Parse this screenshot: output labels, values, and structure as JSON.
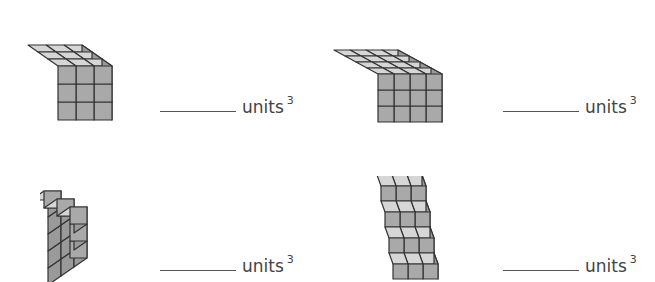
{
  "problems": [
    {
      "id": 1,
      "shape": "rectangular-prism",
      "dims": {
        "width": 3,
        "depth": 3,
        "height": 3
      },
      "answer_blank": "",
      "unit_label": "units",
      "exponent": "3"
    },
    {
      "id": 2,
      "shape": "rectangular-prism",
      "dims": {
        "width": 4,
        "depth": 4,
        "height": 3
      },
      "answer_blank": "",
      "unit_label": "units",
      "exponent": "3"
    },
    {
      "id": 3,
      "shape": "staircase",
      "column_heights": [
        5,
        4,
        3
      ],
      "depth": 1,
      "answer_blank": "",
      "unit_label": "units",
      "exponent": "3"
    },
    {
      "id": 4,
      "shape": "staircase",
      "row_heights": [
        4,
        3,
        2,
        1
      ],
      "width": 3,
      "answer_blank": "",
      "unit_label": "units",
      "exponent": "3"
    }
  ],
  "colors": {
    "top": "#d6d6d6",
    "front": "#a9a9a9",
    "side": "#9a9a9a",
    "edge": "#333333",
    "text": "#444444"
  }
}
